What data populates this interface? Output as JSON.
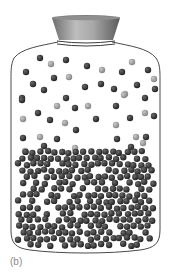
{
  "figure": {
    "label": "(b)",
    "colors": {
      "outline": "#4a4a4a",
      "dark_molecule": "#2b2b2b",
      "light_molecule": "#9a9a9a",
      "cap_top": "#8c8c8c",
      "cap_mid": "#b5b5b5",
      "cap_dark": "#5e5e5e",
      "background": "#ffffff"
    },
    "bottle": {
      "cap": {
        "top_left": 52,
        "top_right": 120,
        "top_y": 17,
        "bottom_left": 59,
        "bottom_right": 113,
        "bottom_y": 40
      },
      "neck_rings_y": [
        41,
        44
      ]
    },
    "vapor_molecules": [
      {
        "x": 40,
        "y": 58,
        "t": "d"
      },
      {
        "x": 51,
        "y": 64,
        "t": "l"
      },
      {
        "x": 66,
        "y": 60,
        "t": "d"
      },
      {
        "x": 26,
        "y": 72,
        "t": "d"
      },
      {
        "x": 54,
        "y": 78,
        "t": "d"
      },
      {
        "x": 69,
        "y": 77,
        "t": "l"
      },
      {
        "x": 87,
        "y": 66,
        "t": "d"
      },
      {
        "x": 102,
        "y": 70,
        "t": "l"
      },
      {
        "x": 122,
        "y": 72,
        "t": "d"
      },
      {
        "x": 132,
        "y": 62,
        "t": "l"
      },
      {
        "x": 148,
        "y": 70,
        "t": "d"
      },
      {
        "x": 154,
        "y": 79,
        "t": "l"
      },
      {
        "x": 33,
        "y": 84,
        "t": "d"
      },
      {
        "x": 44,
        "y": 90,
        "t": "d"
      },
      {
        "x": 85,
        "y": 87,
        "t": "d"
      },
      {
        "x": 101,
        "y": 84,
        "t": "d"
      },
      {
        "x": 114,
        "y": 89,
        "t": "d"
      },
      {
        "x": 125,
        "y": 94,
        "t": "l"
      },
      {
        "x": 137,
        "y": 85,
        "t": "d"
      },
      {
        "x": 155,
        "y": 89,
        "t": "d"
      },
      {
        "x": 22,
        "y": 98,
        "t": "d"
      },
      {
        "x": 66,
        "y": 98,
        "t": "d"
      },
      {
        "x": 145,
        "y": 98,
        "t": "d"
      },
      {
        "x": 22,
        "y": 100,
        "t": "d"
      },
      {
        "x": 124,
        "y": 95,
        "t": "l"
      },
      {
        "x": 57,
        "y": 106,
        "t": "l"
      },
      {
        "x": 75,
        "y": 108,
        "t": "d"
      },
      {
        "x": 88,
        "y": 106,
        "t": "l"
      },
      {
        "x": 116,
        "y": 106,
        "t": "d"
      },
      {
        "x": 38,
        "y": 113,
        "t": "d"
      },
      {
        "x": 23,
        "y": 119,
        "t": "l"
      },
      {
        "x": 50,
        "y": 120,
        "t": "d"
      },
      {
        "x": 65,
        "y": 123,
        "t": "l"
      },
      {
        "x": 96,
        "y": 119,
        "t": "d"
      },
      {
        "x": 130,
        "y": 118,
        "t": "d"
      },
      {
        "x": 145,
        "y": 113,
        "t": "l"
      },
      {
        "x": 154,
        "y": 116,
        "t": "d"
      },
      {
        "x": 76,
        "y": 130,
        "t": "d"
      },
      {
        "x": 116,
        "y": 125,
        "t": "l"
      },
      {
        "x": 23,
        "y": 138,
        "t": "d"
      },
      {
        "x": 40,
        "y": 137,
        "t": "l"
      },
      {
        "x": 57,
        "y": 139,
        "t": "d"
      },
      {
        "x": 117,
        "y": 139,
        "t": "d"
      },
      {
        "x": 136,
        "y": 137,
        "t": "l"
      },
      {
        "x": 146,
        "y": 137,
        "t": "d"
      },
      {
        "x": 143,
        "y": 143,
        "t": "l"
      },
      {
        "x": 75,
        "y": 148,
        "t": "l"
      },
      {
        "x": 44,
        "y": 146,
        "t": "d"
      },
      {
        "x": 25,
        "y": 151,
        "t": "l"
      },
      {
        "x": 131,
        "y": 147,
        "t": "d"
      }
    ],
    "liquid": {
      "top_y": 152,
      "bottom_y": 246,
      "left_x": 14,
      "right_x": 160,
      "spacing": 7.2,
      "radius": 3.2
    }
  }
}
